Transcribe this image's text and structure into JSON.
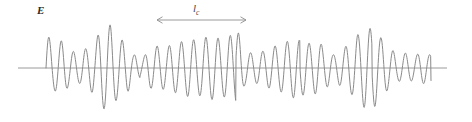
{
  "figure": {
    "title": "",
    "field_label": "E",
    "coherence_label_base": "l",
    "coherence_label_sub": "c",
    "line_color": "#8a8a8a",
    "axis_color": "#9a9a9a",
    "text_color": "#2b2b2b",
    "background": "#ffffff"
  },
  "annotations": {
    "coherence_arrow": {
      "name": "coherence-length-arrow",
      "x_start": 157,
      "x_end": 246,
      "y": 20,
      "double_headed": true
    }
  },
  "chart_data": {
    "type": "line",
    "title": "",
    "xlabel": "",
    "ylabel": "E",
    "grid": false,
    "legend": null,
    "axis": {
      "baseline_y_px": 68,
      "baseline_x_start_px": 18,
      "baseline_x_end_px": 447,
      "xlim": [
        0,
        472
      ],
      "ylim": [
        -1.15,
        1.15
      ]
    },
    "waveform": {
      "x_start": 46,
      "x_end": 431,
      "mean_period_px": 12.2,
      "amplitude_scale_px": 44,
      "phase_jumps": [
        {
          "x": 140,
          "delta": 0.9
        },
        {
          "x": 236,
          "delta": 2.1
        },
        {
          "x": 300,
          "delta": 1.3
        },
        {
          "x": 372,
          "delta": 0.7
        }
      ],
      "envelope_points": [
        {
          "x": 46,
          "a": 0.78
        },
        {
          "x": 54,
          "a": 0.52
        },
        {
          "x": 62,
          "a": 0.62
        },
        {
          "x": 70,
          "a": 0.4
        },
        {
          "x": 78,
          "a": 0.34
        },
        {
          "x": 86,
          "a": 0.44
        },
        {
          "x": 94,
          "a": 0.58
        },
        {
          "x": 102,
          "a": 0.92
        },
        {
          "x": 110,
          "a": 0.98
        },
        {
          "x": 118,
          "a": 0.7
        },
        {
          "x": 126,
          "a": 0.58
        },
        {
          "x": 134,
          "a": 0.3
        },
        {
          "x": 142,
          "a": 0.22
        },
        {
          "x": 150,
          "a": 0.46
        },
        {
          "x": 158,
          "a": 0.5
        },
        {
          "x": 166,
          "a": 0.48
        },
        {
          "x": 174,
          "a": 0.56
        },
        {
          "x": 182,
          "a": 0.6
        },
        {
          "x": 190,
          "a": 0.66
        },
        {
          "x": 198,
          "a": 0.62
        },
        {
          "x": 206,
          "a": 0.7
        },
        {
          "x": 214,
          "a": 0.72
        },
        {
          "x": 222,
          "a": 0.64
        },
        {
          "x": 230,
          "a": 0.74
        },
        {
          "x": 238,
          "a": 0.8
        },
        {
          "x": 246,
          "a": 0.36
        },
        {
          "x": 254,
          "a": 0.34
        },
        {
          "x": 262,
          "a": 0.38
        },
        {
          "x": 270,
          "a": 0.46
        },
        {
          "x": 278,
          "a": 0.52
        },
        {
          "x": 286,
          "a": 0.6
        },
        {
          "x": 294,
          "a": 0.68
        },
        {
          "x": 302,
          "a": 0.62
        },
        {
          "x": 310,
          "a": 0.56
        },
        {
          "x": 318,
          "a": 0.6
        },
        {
          "x": 326,
          "a": 0.44
        },
        {
          "x": 334,
          "a": 0.3
        },
        {
          "x": 342,
          "a": 0.42
        },
        {
          "x": 350,
          "a": 0.58
        },
        {
          "x": 358,
          "a": 0.76
        },
        {
          "x": 366,
          "a": 0.92
        },
        {
          "x": 374,
          "a": 0.88
        },
        {
          "x": 382,
          "a": 0.68
        },
        {
          "x": 390,
          "a": 0.44
        },
        {
          "x": 398,
          "a": 0.3
        },
        {
          "x": 406,
          "a": 0.34
        },
        {
          "x": 414,
          "a": 0.28
        },
        {
          "x": 422,
          "a": 0.36
        },
        {
          "x": 431,
          "a": 0.3
        }
      ]
    }
  }
}
